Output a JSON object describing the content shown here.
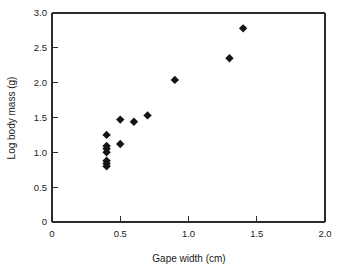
{
  "chart_data": {
    "type": "scatter",
    "title": "",
    "xlabel": "Gape width (cm)",
    "ylabel": "Log body mass (g)",
    "xlim": [
      0,
      2.0
    ],
    "ylim": [
      0,
      3.0
    ],
    "xticks": [
      0,
      0.5,
      1.0,
      1.5,
      2.0
    ],
    "xticklabels": [
      "0",
      "0.5",
      "1.0",
      "1.5",
      "2.0"
    ],
    "yticks": [
      0,
      0.5,
      1.0,
      1.5,
      2.0,
      2.5,
      3.0
    ],
    "yticklabels": [
      "0",
      "0.5",
      "1.0",
      "1.5",
      "2.0",
      "2.5",
      "3.0"
    ],
    "grid": false,
    "legend": false,
    "marker": "diamond",
    "marker_color": "#151515",
    "points": [
      {
        "x": 0.4,
        "y": 0.8
      },
      {
        "x": 0.4,
        "y": 0.84
      },
      {
        "x": 0.4,
        "y": 0.88
      },
      {
        "x": 0.4,
        "y": 1.0
      },
      {
        "x": 0.4,
        "y": 1.05
      },
      {
        "x": 0.4,
        "y": 1.09
      },
      {
        "x": 0.4,
        "y": 1.25
      },
      {
        "x": 0.5,
        "y": 1.12
      },
      {
        "x": 0.5,
        "y": 1.47
      },
      {
        "x": 0.6,
        "y": 1.44
      },
      {
        "x": 0.7,
        "y": 1.53
      },
      {
        "x": 0.9,
        "y": 2.04
      },
      {
        "x": 1.3,
        "y": 2.35
      },
      {
        "x": 1.4,
        "y": 2.78
      }
    ]
  }
}
